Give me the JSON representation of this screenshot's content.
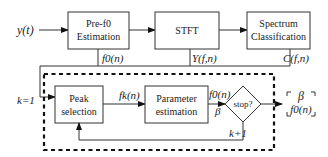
{
  "diagram": {
    "input_label": "y(t)",
    "blocks": {
      "pre_f0": {
        "line1": "Pre-f0",
        "line2": "Estimation"
      },
      "stft": {
        "line1": "STFT"
      },
      "spectrum": {
        "line1": "Spectrum",
        "line2": "Classification"
      },
      "peak": {
        "line1": "Peak",
        "line2": "selection"
      },
      "param": {
        "line1": "Parameter",
        "line2": "estimation"
      },
      "stop": {
        "line1": "stop?"
      }
    },
    "edge_labels": {
      "f0n_pre": "f0(n)",
      "yfn": "Y(f,n)",
      "cfn": "C(f,n)",
      "k_init": "k=1",
      "fkn": "fk(n)",
      "f0n_param": "f0(n)",
      "beta_param": "β",
      "k_next": "k+1"
    },
    "output": {
      "line1": "β",
      "line2": "f0(n)"
    },
    "colors": {
      "stroke": "#333333",
      "text": "#222222",
      "background": "#ffffff"
    }
  }
}
